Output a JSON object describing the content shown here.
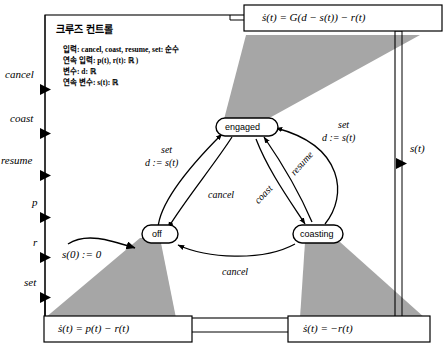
{
  "diagram": {
    "title": "크루즈 컨트롤",
    "spec": [
      "입력: cancel, coast, resume, set: 순수",
      "연속 입력: p(t), r(t): ℝ )",
      "변수: d: ℝ",
      "연속 변수: s(t): ℝ"
    ],
    "colors": {
      "shade": "#a6a6a6",
      "line": "#000000",
      "background": "#ffffff",
      "boxfill": "#ffffff"
    }
  },
  "input_ports": [
    {
      "label": "cancel"
    },
    {
      "label": "coast"
    },
    {
      "label": "resume"
    },
    {
      "label": "p"
    },
    {
      "label": "r"
    },
    {
      "label": "set"
    }
  ],
  "output_ports": [
    {
      "label": "s(t)"
    }
  ],
  "states": [
    {
      "id": "engaged",
      "label": "engaged"
    },
    {
      "id": "off",
      "label": "off"
    },
    {
      "id": "coasting",
      "label": "coasting"
    }
  ],
  "initial_transition": {
    "action": "s(0)  :=  0"
  },
  "transitions": [
    {
      "from": "off",
      "to": "engaged",
      "guard": "set",
      "action": "d := s(t)"
    },
    {
      "from": "engaged",
      "to": "off",
      "guard": "cancel",
      "action": ""
    },
    {
      "from": "engaged",
      "to": "coasting",
      "guard": "coast",
      "action": ""
    },
    {
      "from": "coasting",
      "to": "engaged",
      "guard": "resume",
      "action": ""
    },
    {
      "from": "coasting",
      "to": "engaged",
      "guard": "set",
      "action": "d := s(t)"
    },
    {
      "from": "coasting",
      "to": "off",
      "guard": "cancel",
      "action": ""
    }
  ],
  "refinement_boxes": [
    {
      "for": "engaged",
      "equation": "ṡ(t)   =   G(d − s(t)) − r(t)"
    },
    {
      "for": "off",
      "equation": "ṡ(t)   =   p(t) − r(t)"
    },
    {
      "for": "coasting",
      "equation": "ṡ(t)   =   −r(t)"
    }
  ]
}
